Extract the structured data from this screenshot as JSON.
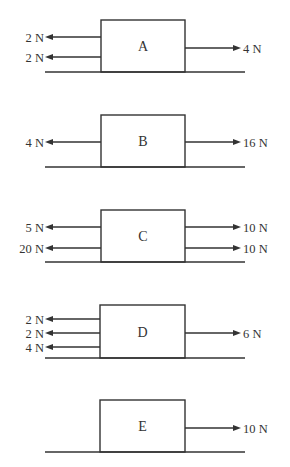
{
  "diagrams": [
    {
      "label": "A",
      "box": {
        "x": 101,
        "y": 20,
        "w": 84,
        "h": 52
      },
      "ground_y": 72,
      "left": [
        {
          "text": "2 N",
          "y": 37
        },
        {
          "text": "2 N",
          "y": 57
        }
      ],
      "right": [
        {
          "text": "4 N",
          "y": 48
        }
      ]
    },
    {
      "label": "B",
      "box": {
        "x": 101,
        "y": 115,
        "w": 84,
        "h": 52
      },
      "ground_y": 167,
      "left": [
        {
          "text": "4 N",
          "y": 142
        }
      ],
      "right": [
        {
          "text": "16 N",
          "y": 142
        }
      ]
    },
    {
      "label": "C",
      "box": {
        "x": 101,
        "y": 210,
        "w": 84,
        "h": 52
      },
      "ground_y": 262,
      "left": [
        {
          "text": "5 N",
          "y": 227
        },
        {
          "text": "20 N",
          "y": 248
        }
      ],
      "right": [
        {
          "text": "10 N",
          "y": 227
        },
        {
          "text": "10 N",
          "y": 248
        }
      ]
    },
    {
      "label": "D",
      "box": {
        "x": 100,
        "y": 305,
        "w": 85,
        "h": 53
      },
      "ground_y": 358,
      "left": [
        {
          "text": "2 N",
          "y": 319
        },
        {
          "text": "2 N",
          "y": 333
        },
        {
          "text": "4 N",
          "y": 347
        }
      ],
      "right": [
        {
          "text": "6 N",
          "y": 333
        }
      ]
    },
    {
      "label": "E",
      "box": {
        "x": 100,
        "y": 400,
        "w": 85,
        "h": 52
      },
      "ground_y": 452,
      "left": [],
      "right": [
        {
          "text": "10 N",
          "y": 428
        }
      ]
    }
  ],
  "colors": {
    "stroke": "#333333",
    "background": "#ffffff"
  }
}
